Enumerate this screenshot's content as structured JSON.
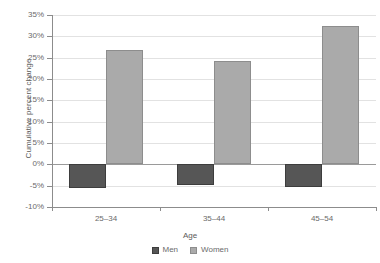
{
  "chart_data": {
    "type": "bar",
    "title": "",
    "subtitle": "",
    "xlabel": "Age",
    "ylabel": "Cumulative percent change",
    "categories": [
      "25–34",
      "35–44",
      "45–54"
    ],
    "series": [
      {
        "name": "Men",
        "color": "#565656",
        "values": [
          -5.5,
          -4.8,
          -5.3
        ]
      },
      {
        "name": "Women",
        "color": "#aaaaaa",
        "values": [
          26.7,
          24.3,
          32.5
        ]
      }
    ],
    "ylim": [
      -10,
      35
    ],
    "ytick_step": 5,
    "ytick_labels": [
      "35%",
      "30%",
      "25%",
      "20%",
      "15%",
      "10%",
      "5%",
      "0%",
      "-5%",
      "-10%"
    ],
    "ytick_values": [
      35,
      30,
      25,
      20,
      15,
      10,
      5,
      0,
      -5,
      -10
    ],
    "grid": true,
    "grid_axis": "y",
    "legend_position": "bottom",
    "legend_entries": [
      "Men",
      "Women"
    ],
    "zero_line": 0
  }
}
